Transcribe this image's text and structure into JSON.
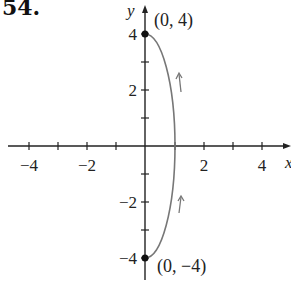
{
  "problem_number": "54.",
  "axes": {
    "x_label": "x",
    "y_label": "y",
    "x_ticks": [
      -4,
      -3,
      -2,
      -1,
      1,
      2,
      3,
      4
    ],
    "x_tick_labels": [
      "−4",
      "−2",
      "2",
      "4"
    ],
    "y_ticks": [
      -4,
      -3,
      -2,
      -1,
      1,
      2,
      3,
      4
    ],
    "y_tick_labels": [
      "4",
      "2",
      "−2",
      "−4"
    ]
  },
  "points": [
    {
      "label": "(0, 4)",
      "x": 0,
      "y": 4
    },
    {
      "label": "(0, −4)",
      "x": 0,
      "y": -4
    }
  ],
  "curve": {
    "description": "Right half of ellipse x^2 + y^2/16 = 1, traced from (0,-4) to (0,4)",
    "direction": "counterclockwise (upward)",
    "color": "#777777"
  },
  "colors": {
    "axis": "#222222",
    "curve": "#777777",
    "points": "#111111"
  }
}
